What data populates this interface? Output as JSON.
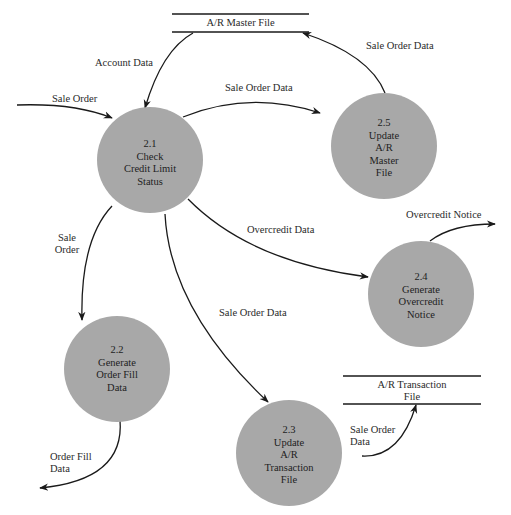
{
  "caption": "Figure 2 — Level 1 data flow diagram: expanded process (partially cut off)",
  "data_stores": {
    "ar_master": {
      "label": "A/R Master File"
    },
    "ar_transaction": {
      "line1": "A/R Transaction",
      "line2": "File"
    }
  },
  "processes": {
    "p21": {
      "id": "2.1",
      "lines": [
        "Check",
        "Credit Limit",
        "Status"
      ]
    },
    "p22": {
      "id": "2.2",
      "lines": [
        "Generate",
        "Order Fill",
        "Data"
      ]
    },
    "p23": {
      "id": "2.3",
      "lines": [
        "Update",
        "A/R",
        "Transaction",
        "File"
      ]
    },
    "p24": {
      "id": "2.4",
      "lines": [
        "Generate",
        "Overcredit",
        "Notice"
      ]
    },
    "p25": {
      "id": "2.5",
      "lines": [
        "Update",
        "A/R",
        "Master",
        "File"
      ]
    }
  },
  "flows": {
    "sale_order_in": "Sale Order",
    "account_data": "Account Data",
    "sale_order_data_21_25": "Sale Order Data",
    "sale_order_data_25_master": "Sale Order Data",
    "overcredit_data": "Overcredit Data",
    "overcredit_notice": "Overcredit Notice",
    "sale_order_21_22": {
      "line1": "Sale",
      "line2": "Order"
    },
    "sale_order_data_21_23": "Sale Order Data",
    "sale_order_data_23_trans": {
      "line1": "Sale Order",
      "line2": "Data"
    },
    "order_fill_data": {
      "line1": "Order Fill",
      "line2": "Data"
    }
  },
  "colors": {
    "process_fill": "#a8a8a8",
    "line": "#1a1a1a",
    "text": "#222222"
  }
}
